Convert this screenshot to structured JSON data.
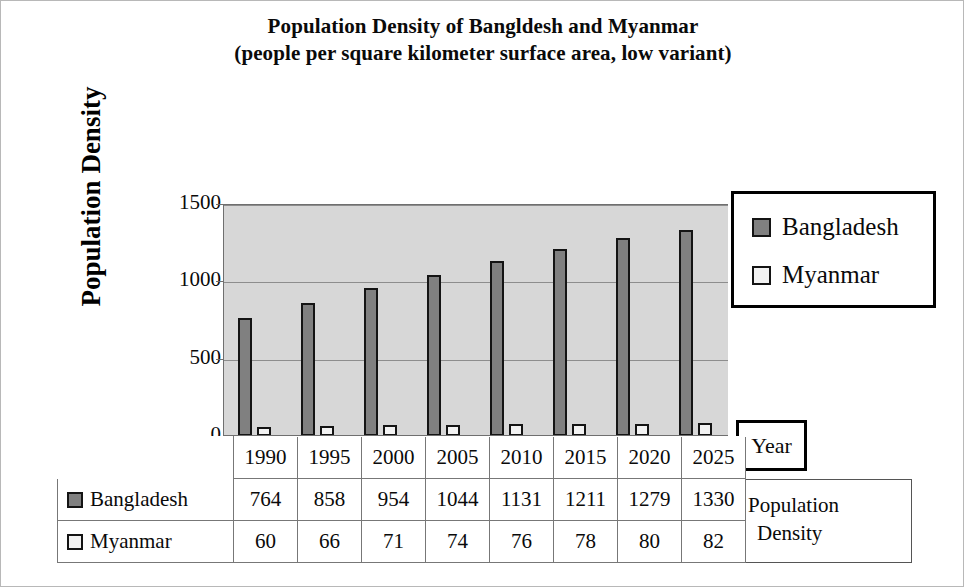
{
  "title": {
    "line1": "Population Density of Bangldesh and Myanmar",
    "line2": "(people per square kilometer surface area, low variant)"
  },
  "axis": {
    "y_title": "Population Density",
    "x_title": "Year",
    "value_title_line1": "Population",
    "value_title_line2": "Density"
  },
  "legend": {
    "items": [
      {
        "label": "Bangladesh",
        "color": "#808080"
      },
      {
        "label": "Myanmar",
        "color": "#f2f2f2"
      }
    ]
  },
  "table": {
    "row_labels": [
      "Bangladesh",
      "Myanmar"
    ],
    "years": [
      "1990",
      "1995",
      "2000",
      "2005",
      "2010",
      "2015",
      "2020",
      "2025"
    ],
    "bangladesh": [
      "764",
      "858",
      "954",
      "1044",
      "1131",
      "1211",
      "1279",
      "1330"
    ],
    "myanmar": [
      "60",
      "66",
      "71",
      "74",
      "76",
      "78",
      "80",
      "82"
    ]
  },
  "chart_data": {
    "type": "bar",
    "title": "Population Density of Bangldesh and Myanmar (people per square kilometer surface area, low variant)",
    "xlabel": "Year",
    "ylabel": "Population Density",
    "categories": [
      "1990",
      "1995",
      "2000",
      "2005",
      "2010",
      "2015",
      "2020",
      "2025"
    ],
    "series": [
      {
        "name": "Bangladesh",
        "color": "#808080",
        "values": [
          764,
          858,
          954,
          1044,
          1131,
          1211,
          1279,
          1330
        ]
      },
      {
        "name": "Myanmar",
        "color": "#f2f2f2",
        "values": [
          60,
          66,
          71,
          74,
          76,
          78,
          80,
          82
        ]
      }
    ],
    "ylim": [
      0,
      1500
    ],
    "yticks": [
      0,
      500,
      1000,
      1500
    ],
    "ytick_labels": [
      "0",
      "500",
      "1000",
      "1500"
    ],
    "grid": true,
    "legend_position": "right",
    "plot_background": "#d7d7d7"
  }
}
